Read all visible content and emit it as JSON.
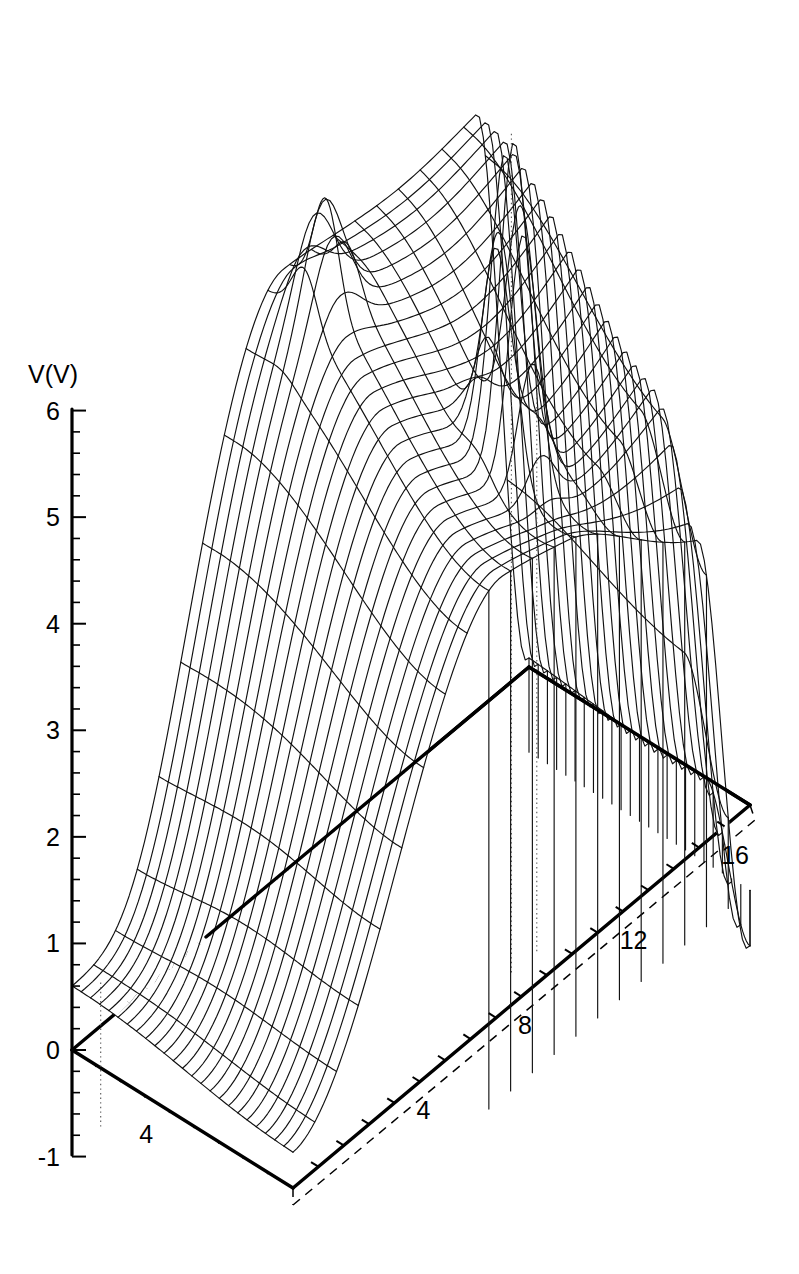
{
  "figure": {
    "kind": "3d-wireframe-surface",
    "background_color": "#ffffff",
    "line_color": "#111111"
  },
  "axes": {
    "vertical": {
      "title": "V(V)",
      "tick_labels": [
        "6",
        "5",
        "4",
        "3",
        "2",
        "1",
        "0",
        "-1"
      ],
      "tick_values": [
        6,
        5,
        4,
        3,
        2,
        1,
        0,
        -1
      ],
      "min": -1,
      "max": 6,
      "minor_ticks_per_interval": 5
    },
    "left_front": {
      "title": "",
      "tick_labels": [
        "4"
      ],
      "tick_values": [
        4
      ],
      "min": 0,
      "max": 9,
      "tick_step": 1
    },
    "right_front": {
      "title": "",
      "tick_labels": [
        "4",
        "8",
        "12",
        "16"
      ],
      "tick_values": [
        4,
        8,
        12,
        16
      ],
      "min": 0,
      "max": 18,
      "tick_step": 1
    }
  },
  "chart_data": {
    "type": "surface",
    "title": "",
    "xlabel": "",
    "ylabel": "",
    "zlabel": "V(V)",
    "zlim": [
      -1,
      6
    ],
    "xlim": [
      0,
      18
    ],
    "ylim": [
      0,
      9
    ],
    "grid": false,
    "legend": "none",
    "annotations": [],
    "surface_profile": {
      "peak_height": 6.9,
      "secondary_ridge_height": 5.4,
      "plateau_height": 3.6,
      "front_low_height": 0.55,
      "baseplane_height": -0.75
    },
    "mesh": {
      "u_lines": 26,
      "v_lines": 22
    }
  }
}
